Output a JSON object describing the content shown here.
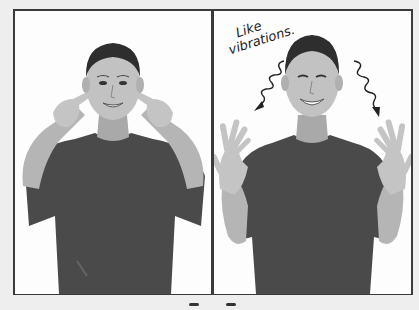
{
  "figure": {
    "panels": [
      {
        "id": "left",
        "subject": "boy pointing index fingers at both ears",
        "annotation": ""
      },
      {
        "id": "right",
        "subject": "boy holding both open hands up beside shoulders",
        "annotation": {
          "line1": "Like",
          "line2": "vibrations."
        },
        "arrows": [
          "squiggly-arrow-left",
          "squiggly-arrow-right"
        ]
      }
    ]
  },
  "colors": {
    "frame_border": "#3a3a3a",
    "background": "#eeeeee",
    "panel_background": "#fdfdfd",
    "shirt": "#4a4a4a",
    "skin": "#bdbdbd",
    "hair": "#2e2e2e"
  }
}
